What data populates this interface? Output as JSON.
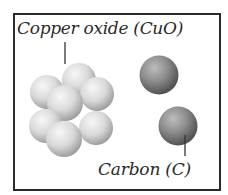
{
  "diagram": {
    "labels": {
      "copper_oxide": "Copper oxide (CuO)",
      "carbon": "Carbon (C)"
    },
    "colors": {
      "frame": "#2b2b2b",
      "copper_oxide_sphere": "#d8d8d8",
      "carbon_sphere": "#8a8a8a",
      "leader_line": "#333333",
      "text": "#2a2a2a"
    },
    "copper_oxide_cluster": {
      "sphere_count": 8
    },
    "carbon_atoms": {
      "count": 2
    }
  }
}
